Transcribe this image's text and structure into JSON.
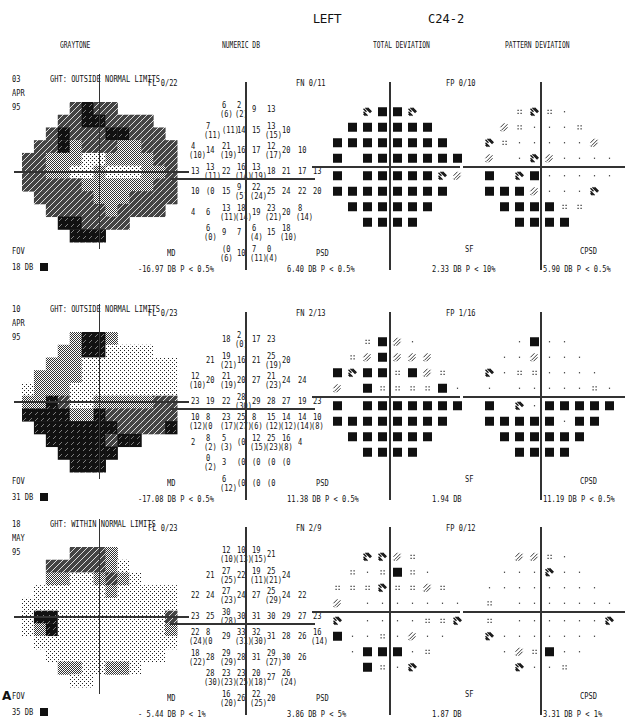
{
  "header": {
    "eye": "LEFT",
    "program": "C24-2",
    "columns": [
      "GRAYTONE",
      "NUMERIC DB",
      "TOTAL DEVIATION",
      "PATTERN DEVIATION"
    ]
  },
  "panel_label": "A",
  "legend": {
    "symbols": {
      "dot": "P ≥ 5% (normal)",
      "dbl_dot": "P < 5%",
      "checker": "P < 2%",
      "hatch": "P < 1%",
      "black": "P < 0.5%"
    }
  },
  "chart_data": [
    {
      "type": "heatmap",
      "title": "Visual field exam 03 APR 95",
      "date": {
        "day": "03",
        "month": "APR",
        "year": "95"
      },
      "ght": "GHT: OUTSIDE NORMAL LIMITS",
      "fl": "FL  0/22",
      "fn": "FN  0/11",
      "fp": "FP  0/10",
      "fov_label": "FOV",
      "fov_value": "18 DB",
      "indices": {
        "md_label": "MD",
        "md": "-16.97 DB   P < 0.5%",
        "psd_label": "PSD",
        "psd": "6.40 DB   P < 0.5%",
        "sf_label": "SF",
        "sf": "2.33 DB   P <  10%",
        "cpsd_label": "CPSD",
        "cpsd": "5.90 DB   P < 0.5%"
      },
      "grayscale_rows": [
        "....3433.....",
        "...33443333..",
        "..3433344333.",
        ".334233322333",
        "3322211222233",
        "3322112111223",
        "3333322222233",
        ".333332223333",
        "..3333323333.",
        "...443333....",
        "....444......"
      ],
      "numeric_db": [
        [
          null,
          null,
          null,
          "6|(6)",
          "2|(2)",
          "9",
          "13",
          null,
          null,
          null
        ],
        [
          null,
          null,
          "7|(11)",
          "(11)",
          "14",
          "15",
          "13|(15)",
          "10",
          null,
          null
        ],
        [
          null,
          "4|(10)",
          "14",
          "21|(19)",
          "16",
          "17",
          "12|(17)",
          "20",
          "10",
          null
        ],
        [
          null,
          "13",
          "13|(11)",
          "22",
          "16|(14)",
          "13|(19)",
          "18",
          "21",
          "17",
          "13"
        ],
        [
          null,
          "10",
          "(0",
          "15",
          "9|(5)",
          "22|(24)",
          "25",
          "24",
          "22",
          "20"
        ],
        [
          null,
          "4",
          "6",
          "13|(11)",
          "18|(14)",
          "19",
          "23|(21)",
          "20",
          "8|(14)",
          null
        ],
        [
          null,
          null,
          "6|(0)",
          "9",
          "7",
          "6|(4)",
          "15",
          "18|(10)",
          null,
          null
        ],
        [
          null,
          null,
          null,
          "(0|(6)",
          "10",
          "7|(11)",
          "0|(4)",
          null,
          null,
          null
        ]
      ],
      "total_deviation": [
        [
          null,
          null,
          "H",
          "B",
          "B",
          "H",
          null,
          null,
          null
        ],
        [
          null,
          "B",
          "B",
          "B",
          "B",
          "B",
          "B",
          null,
          null
        ],
        [
          "B",
          "B",
          "B",
          "B",
          "B",
          "B",
          "B",
          "B",
          null
        ],
        [
          "B",
          null,
          "B",
          "B",
          "B",
          "B",
          "B",
          "B",
          "B"
        ],
        [
          "B",
          null,
          "B",
          "B",
          "B",
          "B",
          "B",
          "H",
          "C"
        ],
        [
          "B",
          "B",
          "B",
          "B",
          "B",
          "B",
          "B",
          "B",
          null
        ],
        [
          null,
          "B",
          "B",
          "B",
          "B",
          "B",
          "B",
          null,
          null
        ],
        [
          null,
          null,
          "B",
          "B",
          "B",
          "B",
          null,
          null,
          null
        ]
      ],
      "pattern_deviation": [
        [
          null,
          null,
          "D",
          "H",
          "D",
          "d",
          null,
          null,
          null
        ],
        [
          null,
          "C",
          "D",
          "d",
          "d",
          "d",
          "D",
          null,
          null
        ],
        [
          "H",
          "D",
          "d",
          "d",
          "d",
          "d",
          "d",
          "C",
          null
        ],
        [
          "C",
          null,
          "d",
          "H",
          "C",
          "d",
          "d",
          "d",
          "d"
        ],
        [
          "B",
          null,
          "H",
          "B",
          "d",
          "d",
          "d",
          "d",
          "d"
        ],
        [
          "B",
          "B",
          "B",
          "C",
          "d",
          "d",
          "d",
          "H",
          null
        ],
        [
          null,
          "B",
          "B",
          "B",
          "B",
          "D",
          "D",
          null,
          null
        ],
        [
          null,
          null,
          "B",
          "B",
          "B",
          "B",
          null,
          null,
          null
        ]
      ]
    },
    {
      "type": "heatmap",
      "title": "Visual field exam 10 APR 95",
      "date": {
        "day": "10",
        "month": "APR",
        "year": "95"
      },
      "ght": "GHT: OUTSIDE NORMAL LIMITS",
      "fl": "FL  0/23",
      "fn": "FN  2/13",
      "fp": "FP  1/16",
      "fov_label": "FOV",
      "fov_value": "31 DB",
      "indices": {
        "md_label": "MD",
        "md": "-17.08 DB   P < 0.5%",
        "psd_label": "PSD",
        "psd": "11.38 DB   P < 0.5%",
        "sf_label": "SF",
        "sf": "1.94 DB",
        "cpsd_label": "CPSD",
        "cpsd": "11.19 DB   P < 0.5%"
      },
      "grayscale_rows": [
        "....2442.....",
        "...22441000..",
        "..22211100101",
        ".222211001000",
        "1222100000001",
        "2243102222233",
        "4444224333333",
        ".444444433334",
        "..44444344...",
        "...44444.....",
        "....444......"
      ],
      "numeric_db": [
        [
          null,
          null,
          null,
          "18",
          "2|(0)",
          "17",
          "23",
          null,
          null,
          null
        ],
        [
          null,
          null,
          "21",
          "19|(21)",
          "16",
          "21",
          "25|(19)",
          "20",
          null,
          null
        ],
        [
          null,
          "12|(10)",
          "20",
          "21|(19)",
          "20",
          "27",
          "21|(23)",
          "24",
          "24",
          null
        ],
        [
          null,
          "23",
          "19",
          "22",
          "28|(30)",
          "29",
          "28",
          "27",
          "19",
          "23"
        ],
        [
          null,
          "10|(12)",
          "8|(0",
          "23|(17)",
          "25|(27)",
          "8|(6)",
          "15|(12)",
          "14|(12)",
          "14|(14)",
          "10|(8)"
        ],
        [
          null,
          "2",
          "8|(2)",
          "5|(3)",
          "(0",
          "12|(15)",
          "25|(23)",
          "16|(8)",
          "4",
          null
        ],
        [
          null,
          null,
          "0|(2)",
          "3",
          "(0",
          "(0",
          "(0",
          "(0",
          null,
          null
        ],
        [
          null,
          null,
          null,
          "6|(12)",
          "(0",
          "(0",
          "(0",
          null,
          null,
          null
        ]
      ],
      "total_deviation": [
        [
          null,
          null,
          "D",
          "B",
          "C",
          "d",
          null,
          null,
          null
        ],
        [
          null,
          "D",
          "C",
          "B",
          "C",
          "C",
          "C",
          null,
          null
        ],
        [
          "B",
          "H",
          "B",
          "B",
          "D",
          "B",
          "C",
          "D",
          null
        ],
        [
          "C",
          null,
          "B",
          "D",
          "D",
          "D",
          "D",
          "B",
          "d"
        ],
        [
          "B",
          null,
          "B",
          "B",
          "B",
          "B",
          "B",
          "B",
          "B"
        ],
        [
          "B",
          "B",
          "B",
          "B",
          "B",
          "B",
          "B",
          "B",
          null
        ],
        [
          null,
          "B",
          "B",
          "B",
          "B",
          "B",
          "B",
          null,
          null
        ],
        [
          null,
          null,
          "B",
          "B",
          "B",
          "B",
          null,
          null,
          null
        ]
      ],
      "pattern_deviation": [
        [
          null,
          null,
          "d",
          "B",
          "d",
          "d",
          null,
          null,
          null
        ],
        [
          null,
          "d",
          "d",
          "C",
          "d",
          "d",
          "d",
          null,
          null
        ],
        [
          "H",
          "d",
          "D",
          "D",
          "d",
          "d",
          "d",
          "d",
          null
        ],
        [
          "d",
          null,
          "d",
          "d",
          "d",
          "d",
          "d",
          "D",
          "d"
        ],
        [
          "B",
          null,
          "H",
          "d",
          "B",
          "B",
          "B",
          "B",
          "B"
        ],
        [
          "B",
          "B",
          "B",
          "B",
          "B",
          "d",
          "B",
          "B",
          null
        ],
        [
          null,
          "B",
          "B",
          "B",
          "B",
          "B",
          "B",
          null,
          null
        ],
        [
          null,
          null,
          "B",
          "B",
          "B",
          "B",
          null,
          null,
          null
        ]
      ]
    },
    {
      "type": "heatmap",
      "title": "Visual field exam 18 MAY 95",
      "date": {
        "day": "18",
        "month": "MAY",
        "year": "95"
      },
      "ght": "GHT: WITHIN NORMAL LIMITS",
      "fl": "FL  0/23",
      "fn": "FN  2/9",
      "fp": "FP  0/12",
      "fov_label": "FOV",
      "fov_value": "35 DB",
      "indices": {
        "md_label": "MD",
        "md": "- 5.44 DB   P <  1%",
        "psd_label": "PSD",
        "psd": "3.86 DB   P <  5%",
        "sf_label": "SF",
        "sf": "1.87 DB",
        "cpsd_label": "CPSD",
        "cpsd": "3.31 DB   P <  1%"
      },
      "grayscale_rows": [
        "....3332.....",
        "..3333320....",
        "..22002320...",
        ".000000200000",
        "0000000000000",
        "0440000000003",
        "0240000000002",
        ".000000000000",
        "..0000000000.",
        "...2200220...",
        "....00......."
      ],
      "numeric_db": [
        [
          null,
          null,
          null,
          "12|(10)",
          "10|(13)",
          "19|(15)",
          "21",
          null,
          null,
          null
        ],
        [
          null,
          null,
          "21",
          "27|(25)",
          "22",
          "19|(11)",
          "25|(21)",
          "24",
          null,
          null
        ],
        [
          null,
          "22",
          "24",
          "27|(23)",
          "24",
          "27",
          "25|(29)",
          "24",
          "22",
          null
        ],
        [
          null,
          "23",
          "25",
          "30|(28)",
          "30",
          "31",
          "30",
          "29",
          "27",
          "23"
        ],
        [
          null,
          "22|(24)",
          "8|(0",
          "29",
          "33|(31)",
          "32|(30)",
          "31",
          "28",
          "26",
          "16|(14)"
        ],
        [
          null,
          "18|(22)",
          "28",
          "29|(29)",
          "28",
          "31",
          "29|(27)",
          "30",
          "26",
          null
        ],
        [
          null,
          null,
          "28|(30)",
          "23|(23)",
          "23|(25)",
          "20|(18)",
          "27",
          "26|(24)",
          null,
          null
        ],
        [
          null,
          null,
          null,
          "16|(20)",
          "26",
          "22|(25)",
          "20",
          null,
          null,
          null
        ]
      ],
      "total_deviation": [
        [
          null,
          null,
          "H",
          "H",
          "C",
          "D",
          null,
          null,
          null
        ],
        [
          null,
          "D",
          "d",
          "D",
          "B",
          "D",
          "d",
          null,
          null
        ],
        [
          "D",
          "D",
          "D",
          "H",
          "D",
          "D",
          "C",
          "D",
          null
        ],
        [
          "C",
          null,
          "d",
          "d",
          "d",
          "d",
          "d",
          "d",
          "d"
        ],
        [
          "H",
          null,
          "d",
          "d",
          "d",
          "d",
          "D",
          "D",
          "H"
        ],
        [
          "B",
          "d",
          "d",
          "D",
          "d",
          "C",
          "d",
          "d",
          null
        ],
        [
          null,
          "d",
          "B",
          "B",
          "B",
          "d",
          "D",
          null,
          null
        ],
        [
          null,
          null,
          "B",
          "D",
          "d",
          "H",
          null,
          null,
          null
        ]
      ],
      "pattern_deviation": [
        [
          null,
          null,
          "C",
          "C",
          "D",
          "d",
          null,
          null,
          null
        ],
        [
          null,
          "d",
          "d",
          "d",
          "H",
          "d",
          "d",
          null,
          null
        ],
        [
          "d",
          "d",
          "d",
          "d",
          "d",
          "d",
          "d",
          "d",
          null
        ],
        [
          "D",
          null,
          "d",
          "d",
          "d",
          "d",
          "d",
          "d",
          "d"
        ],
        [
          "D",
          null,
          "d",
          "d",
          "d",
          "d",
          "d",
          "d",
          "H"
        ],
        [
          "H",
          "d",
          "d",
          "d",
          "d",
          "d",
          "d",
          "d",
          null
        ],
        [
          null,
          "d",
          "C",
          "D",
          "B",
          "d",
          "d",
          null,
          null
        ],
        [
          null,
          null,
          "H",
          "d",
          "d",
          "D",
          null,
          null,
          null
        ]
      ]
    }
  ]
}
